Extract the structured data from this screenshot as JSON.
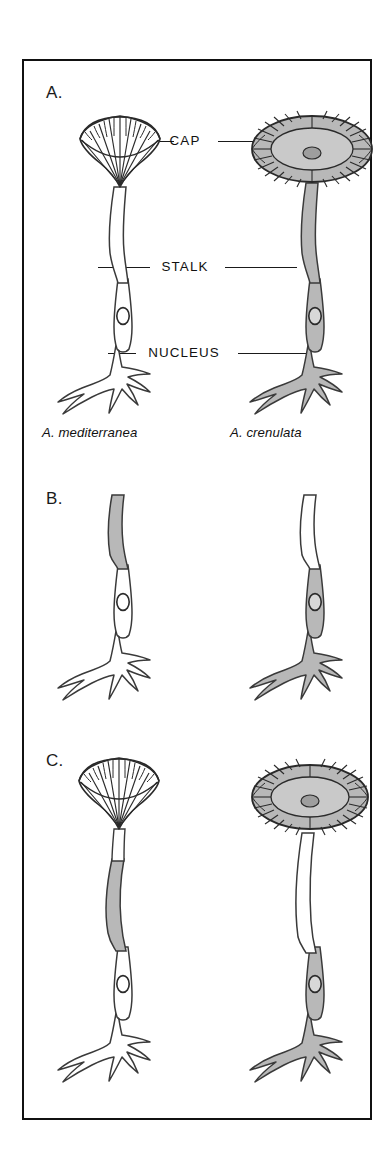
{
  "figure": {
    "border_color": "#111111",
    "fill_gray": "#b8b8b8",
    "fill_white": "#ffffff",
    "outline_color": "#3a3a3a"
  },
  "panels": [
    {
      "id": "A",
      "label": "A.",
      "description": "Intact organisms of two Acetabularia species",
      "callouts": [
        {
          "name": "cap",
          "label": "CAP"
        },
        {
          "name": "stalk",
          "label": "STALK"
        },
        {
          "name": "nucleus",
          "label": "NUCLEUS"
        }
      ],
      "organisms": [
        {
          "side": "left",
          "species_label": "A. mediterranea",
          "cap_type": "cup-fan",
          "cap_fill": "white",
          "stalk_fill": "white",
          "rhizoid_fill": "white",
          "has_nucleus": true
        },
        {
          "side": "right",
          "species_label": "A. crenulata",
          "cap_type": "flat-disc",
          "cap_fill": "gray",
          "stalk_fill": "gray",
          "rhizoid_fill": "gray",
          "has_nucleus": true
        }
      ]
    },
    {
      "id": "B",
      "label": "B.",
      "description": "Caps removed; stalks grafted to foreign rhizoids",
      "callouts": [],
      "organisms": [
        {
          "side": "left",
          "species_label": "",
          "cap_type": "none",
          "cap_fill": "none",
          "stalk_fill": "gray",
          "rhizoid_fill": "white",
          "has_nucleus": true
        },
        {
          "side": "right",
          "species_label": "",
          "cap_type": "none",
          "cap_fill": "none",
          "stalk_fill": "white",
          "rhizoid_fill": "gray",
          "has_nucleus": true
        }
      ]
    },
    {
      "id": "C",
      "label": "C.",
      "description": "Regenerated caps match the nucleus-bearing rhizoid species",
      "callouts": [],
      "organisms": [
        {
          "side": "left",
          "species_label": "",
          "cap_type": "cup-fan",
          "cap_fill": "white",
          "stalk_fill": "gray",
          "rhizoid_fill": "white",
          "has_nucleus": true
        },
        {
          "side": "right",
          "species_label": "",
          "cap_type": "flat-disc",
          "cap_fill": "gray",
          "stalk_fill": "white",
          "rhizoid_fill": "gray",
          "has_nucleus": true
        }
      ]
    }
  ]
}
